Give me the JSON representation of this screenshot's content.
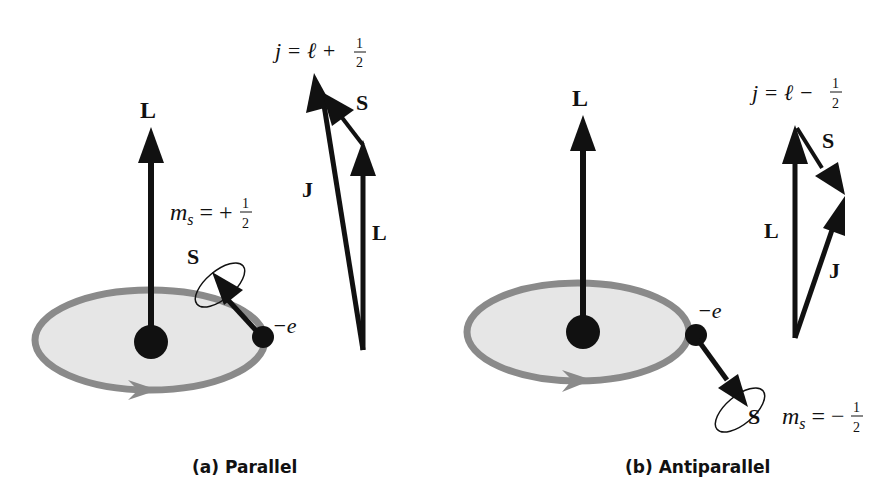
{
  "panel_a": {
    "caption": "(a) Parallel",
    "orbit_L_label": "L",
    "spin_label": "S",
    "charge_label": "−e",
    "ms_label": "m",
    "ms_sub": "s",
    "ms_eq": " = +",
    "ms_num": "1",
    "ms_den": "2",
    "j_eq": "j = ℓ + ",
    "j_num": "1",
    "j_den": "2",
    "vec_S": "S",
    "vec_J": "J",
    "vec_L": "L"
  },
  "panel_b": {
    "caption": "(b) Antiparallel",
    "orbit_L_label": "L",
    "spin_label": "S",
    "charge_label": "−e",
    "ms_label": "m",
    "ms_sub": "s",
    "ms_eq": " = −",
    "ms_num": "1",
    "ms_den": "2",
    "j_eq": "j = ℓ − ",
    "j_num": "1",
    "j_den": "2",
    "vec_S": "S",
    "vec_J": "J",
    "vec_L": "L"
  },
  "colors": {
    "orbit_stroke": "#8a8a8a",
    "orbit_fill": "#e6e6e6",
    "ink": "#111111"
  }
}
